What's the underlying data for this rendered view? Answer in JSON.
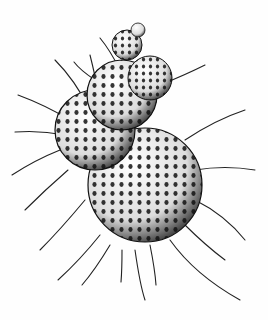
{
  "image": {
    "subject": "foraminifera illustration",
    "style": "black ink stipple drawing on white",
    "colors": {
      "background": "#fefefe",
      "ink": "#111111",
      "shade": "#555555"
    }
  }
}
